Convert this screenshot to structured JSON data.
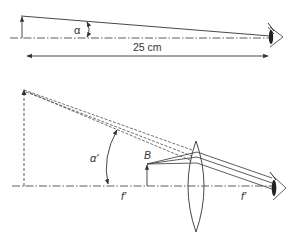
{
  "top_panel": {
    "angle_label": "α",
    "distance_label": "25 cm"
  },
  "bottom_panel": {
    "angle_label": "α'",
    "object_label": "B",
    "focal_label_left": "f'",
    "focal_label_right": "f'"
  },
  "colors": {
    "stroke": "#333333",
    "background": "#ffffff"
  }
}
